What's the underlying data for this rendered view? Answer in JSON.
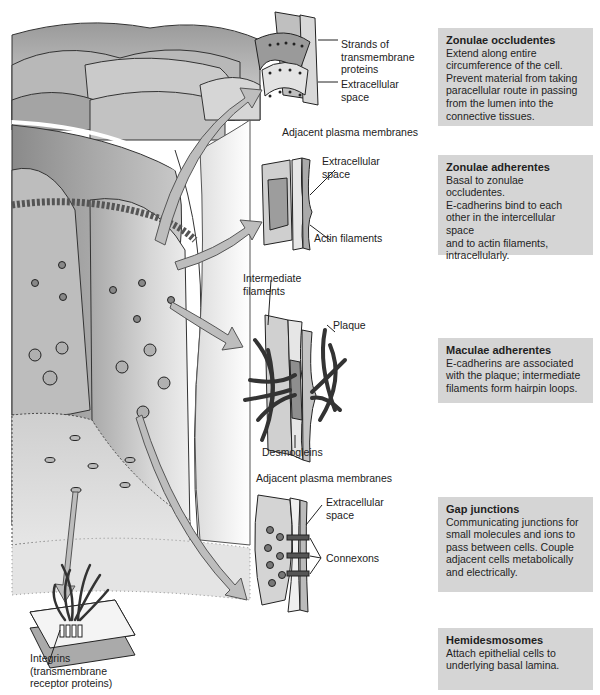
{
  "figure": {
    "diagram_labels": {
      "tight_junction": {
        "strands": "Strands of\ntransmembrane\nproteins",
        "extracellular": "Extracellular\nspace",
        "adjacent_membranes": "Adjacent plasma membranes"
      },
      "adherens_junction": {
        "extracellular": "Extracellular\nspace",
        "actin": "Actin filaments"
      },
      "desmosome": {
        "intermediate": "Intermediate\nfilaments",
        "plaque": "Plaque",
        "desmogleins": "Desmogleins",
        "adjacent_membranes": "Adjacent plasma membranes"
      },
      "gap_junction": {
        "extracellular": "Extracellular\nspace",
        "connexons": "Connexons"
      },
      "hemidesmosome": {
        "integrins": "Integrins\n(transmembrane\nreceptor proteins)"
      }
    },
    "boxes": [
      {
        "title": "Zonulae occludentes",
        "text": "Extend along entire\ncircumference of the cell.\nPrevent material from taking\nparacellular route in passing\nfrom the lumen into the\nconnective tissues."
      },
      {
        "title": "Zonulae adherentes",
        "text": "Basal to zonulae occludentes.\nE-cadherins bind to each\nother in the intercellular space\nand to actin filaments,\nintracellularly."
      },
      {
        "title": "Maculae adherentes",
        "text": "E-cadherins are associated\nwith the plaque; intermediate\nfilaments form hairpin loops."
      },
      {
        "title": "Gap junctions",
        "text": "Communicating junctions for\nsmall molecules and ions to\npass between cells. Couple\nadjacent cells metabolically\nand electrically."
      },
      {
        "title": "Hemidesmosomes",
        "text": "Attach epithelial cells to\nunderlying basal lamina."
      }
    ],
    "colors": {
      "box_fill": "#d5d5d5",
      "arrow_fill": "#bdbdbd",
      "ink": "#222222"
    }
  }
}
